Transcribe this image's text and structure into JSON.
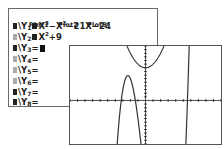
{
  "yeq_screen": {
    "plots": [
      "Plot1",
      "Plot2",
      "Plot3"
    ],
    "functions": [
      {
        "name": "Y",
        "index": "1",
        "expr_html": "X³−X²−21X−24",
        "parts": [
          "X",
          "3",
          "−X",
          "2",
          "−21X−24"
        ],
        "selected": true
      },
      {
        "name": "Y",
        "index": "2",
        "parts": [
          "X",
          "2",
          "+9"
        ],
        "selected": false
      },
      {
        "name": "Y",
        "index": "3",
        "parts": [],
        "selected": true,
        "cursor": true
      },
      {
        "name": "Y",
        "index": "4",
        "parts": [],
        "selected": false
      },
      {
        "name": "Y",
        "index": "5",
        "parts": [],
        "selected": false
      },
      {
        "name": "Y",
        "index": "6",
        "parts": [],
        "selected": false
      },
      {
        "name": "Y",
        "index": "7",
        "parts": [],
        "selected": true
      },
      {
        "name": "Y",
        "index": "8",
        "parts": [],
        "selected": true
      }
    ],
    "equals": "="
  },
  "graph_screen": {
    "window": {
      "xmin": -10,
      "xmax": 10,
      "xscl": 1,
      "ymin": -12,
      "ymax": 15,
      "yscl": 1
    },
    "curves": [
      {
        "label": "Y1",
        "expr": "x^3 - x^2 - 21x - 24"
      },
      {
        "label": "Y2",
        "expr": "x^2 + 9"
      }
    ],
    "axis_color": "#222222",
    "curve_color": "#333333"
  }
}
